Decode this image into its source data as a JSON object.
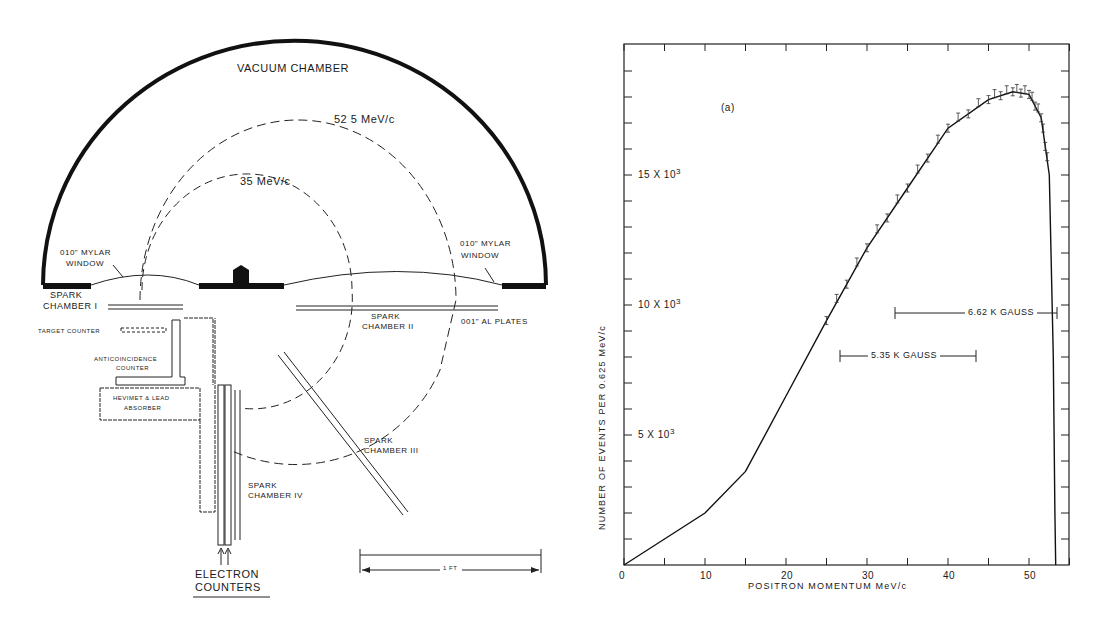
{
  "diagram": {
    "title": "VACUUM CHAMBER",
    "orbit_outer": "52 5 MeV/c",
    "orbit_inner": "35 MeV/c",
    "mylar_left": [
      "010\" MYLAR",
      "WINDOW"
    ],
    "mylar_right": [
      "010\" MYLAR",
      "WINDOW"
    ],
    "spark_chamber_1": [
      "SPARK",
      "CHAMBER I"
    ],
    "spark_chamber_2": [
      "SPARK",
      "CHAMBER II"
    ],
    "spark_chamber_3": [
      "SPARK",
      "CHAMBER III"
    ],
    "spark_chamber_4": [
      "SPARK",
      "CHAMBER IV"
    ],
    "al_plates": "001\" AL PLATES",
    "target_counter": "TARGET COUNTER",
    "anticoincidence": [
      "ANTICOINCIDENCE",
      "COUNTER"
    ],
    "absorber": [
      "HEVIMET & LEAD",
      "ABSORBER"
    ],
    "electron_counters": [
      "ELECTRON",
      "COUNTERS"
    ],
    "scale": "1 FT"
  },
  "chart": {
    "panel_label": "(a)",
    "xlabel": "POSITRON MOMENTUM MeV/c",
    "ylabel": "NUMBER OF EVENTS PER 0.625 MeV/c",
    "xticks": [
      "0",
      "10",
      "20",
      "30",
      "40",
      "50"
    ],
    "yticks": [
      "5 X 10",
      "10 X 10",
      "15 X 10"
    ],
    "ytick_exp": "3",
    "ann_662": "6.62 K GAUSS",
    "ann_535": "5.35 K GAUSS"
  },
  "chart_data": {
    "type": "line",
    "title": "(a)",
    "xlabel": "POSITRON MOMENTUM MeV/c",
    "ylabel": "NUMBER OF EVENTS PER 0.625 MeV/c",
    "xlim": [
      0,
      55
    ],
    "ylim": [
      0,
      20000
    ],
    "x_tick_labels": [
      "0",
      "10",
      "20",
      "30",
      "40",
      "50"
    ],
    "y_tick_labels": [
      "5 X 10^3",
      "10 X 10^3",
      "15 X 10^3"
    ],
    "grid": false,
    "series": [
      {
        "name": "Fitted spectrum",
        "x": [
          0,
          5,
          10,
          15,
          20,
          25,
          30,
          35,
          40,
          45,
          48,
          50,
          51.5,
          52.5,
          53,
          53.2,
          53.3
        ],
        "values": [
          0,
          1000,
          2000,
          3600,
          6500,
          9400,
          12200,
          14500,
          16800,
          17900,
          18200,
          18100,
          17200,
          15000,
          8000,
          2000,
          0
        ]
      }
    ],
    "annotations": [
      {
        "text": "6.62 K GAUSS",
        "x_range": [
          33.5,
          53.5
        ],
        "y": 9700
      },
      {
        "text": "5.35 K GAUSS",
        "x_range": [
          26.5,
          43.5
        ],
        "y": 7100
      },
      {
        "text": "(a)",
        "x": 12.5,
        "y": 17200
      }
    ]
  }
}
